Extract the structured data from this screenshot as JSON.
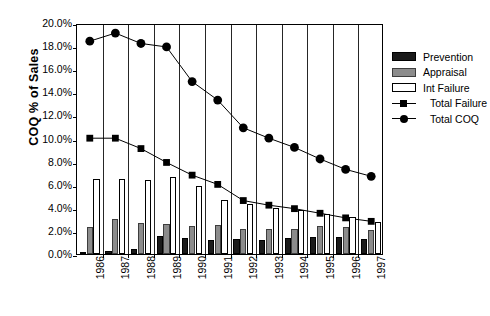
{
  "chart_data": {
    "type": "bar",
    "title": "",
    "xlabel": "",
    "ylabel": "COQ % of Sales",
    "categories": [
      "1986",
      "1987",
      "1988",
      "1989",
      "1990",
      "1991",
      "1992",
      "1993",
      "1994",
      "1995",
      "1996",
      "1997"
    ],
    "ylim": [
      0,
      20
    ],
    "ytick_labels": [
      "20.0%",
      "18.0%",
      "16.0%",
      "14.0%",
      "12.0%",
      "10.0%",
      "8.0%",
      "6.0%",
      "4.0%",
      "2.0%",
      "0.0%"
    ],
    "ytick_values": [
      20,
      18,
      16,
      14,
      12,
      10,
      8,
      6,
      4,
      2,
      0
    ],
    "grid": false,
    "legend_position": "right",
    "series": [
      {
        "name": "Prevention",
        "type": "bar",
        "color": "#1a1a1a",
        "values": [
          0.2,
          0.3,
          0.4,
          1.6,
          1.4,
          1.2,
          1.3,
          1.2,
          1.4,
          1.5,
          1.5,
          1.3
        ]
      },
      {
        "name": "Appraisal",
        "type": "bar",
        "color": "#8c8c8c",
        "values": [
          2.3,
          3.0,
          2.7,
          2.6,
          2.4,
          2.5,
          2.2,
          2.2,
          2.2,
          2.4,
          2.3,
          2.1
        ]
      },
      {
        "name": "Int Failure",
        "type": "bar",
        "color": "#ffffff",
        "values": [
          6.5,
          6.5,
          6.4,
          6.7,
          5.9,
          4.7,
          4.3,
          4.0,
          3.8,
          3.5,
          3.2,
          2.8
        ]
      },
      {
        "name": "Total Failure",
        "type": "line",
        "marker": "square",
        "color": "#000000",
        "values": [
          10.2,
          10.2,
          9.3,
          8.1,
          7.0,
          6.2,
          4.8,
          4.4,
          4.1,
          3.7,
          3.3,
          3.0
        ]
      },
      {
        "name": "Total COQ",
        "type": "line",
        "marker": "circle",
        "color": "#000000",
        "values": [
          18.6,
          19.3,
          18.4,
          18.1,
          15.1,
          13.5,
          11.1,
          10.2,
          9.4,
          8.4,
          7.5,
          6.9
        ]
      }
    ]
  },
  "legend": {
    "items": [
      {
        "label": "Prevention",
        "kind": "swatch",
        "swatch_class": "prevention"
      },
      {
        "label": "Appraisal",
        "kind": "swatch",
        "swatch_class": "appraisal"
      },
      {
        "label": "Int Failure",
        "kind": "swatch",
        "swatch_class": "intfailure"
      },
      {
        "label": "Total Failure",
        "kind": "marker-square"
      },
      {
        "label": "Total COQ",
        "kind": "marker-circle"
      }
    ]
  }
}
